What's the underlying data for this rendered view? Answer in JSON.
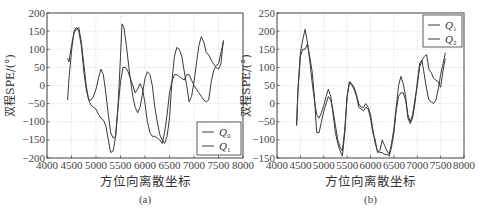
{
  "chart_data": [
    {
      "id": "a",
      "type": "line",
      "caption": "(a)",
      "xlabel": "方位向离散坐标",
      "ylabel": "双程SPE/(°)",
      "xlim": [
        4000,
        8000
      ],
      "ylim": [
        -200,
        200
      ],
      "xticks": [
        4000,
        4500,
        5000,
        5500,
        6000,
        6500,
        7000,
        7500,
        8000
      ],
      "yticks": [
        200,
        150,
        100,
        50,
        0,
        -50,
        -100,
        -150,
        -200
      ],
      "grid": true,
      "legend_position": "lower right",
      "series": [
        {
          "name": "Q0",
          "label_main": "Q",
          "label_sub": "0",
          "x": [
            4420,
            4450,
            4500,
            4550,
            4600,
            4650,
            4700,
            4750,
            4800,
            4850,
            4900,
            4950,
            5000,
            5050,
            5100,
            5150,
            5200,
            5250,
            5300,
            5350,
            5400,
            5450,
            5500,
            5530,
            5570,
            5620,
            5680,
            5750,
            5800,
            5850,
            5900,
            5950,
            6000,
            6050,
            6100,
            6150,
            6200,
            6250,
            6300,
            6350,
            6400,
            6450,
            6500,
            6550,
            6600,
            6650,
            6700,
            6750,
            6800,
            6850,
            6900,
            6950,
            7000,
            7050,
            7100,
            7150,
            7200,
            7250,
            7300,
            7350,
            7400,
            7450,
            7500,
            7550,
            7600
          ],
          "y": [
            -40,
            20,
            95,
            150,
            160,
            150,
            110,
            40,
            -10,
            -40,
            -40,
            -30,
            -10,
            20,
            45,
            30,
            -20,
            -80,
            -130,
            -145,
            -140,
            -60,
            80,
            170,
            160,
            110,
            40,
            -30,
            -60,
            -75,
            -60,
            -20,
            20,
            38,
            30,
            0,
            -60,
            -100,
            -135,
            -150,
            -160,
            -140,
            -90,
            10,
            80,
            105,
            100,
            80,
            40,
            0,
            -45,
            -30,
            10,
            60,
            110,
            135,
            120,
            90,
            85,
            70,
            60,
            50,
            45,
            60,
            125
          ]
        },
        {
          "name": "Q1",
          "label_main": "Q",
          "label_sub": "1",
          "x": [
            4420,
            4450,
            4500,
            4550,
            4600,
            4650,
            4700,
            4750,
            4800,
            4850,
            4900,
            4950,
            5000,
            5050,
            5100,
            5150,
            5200,
            5250,
            5300,
            5350,
            5400,
            5450,
            5500,
            5550,
            5600,
            5650,
            5700,
            5750,
            5800,
            5850,
            5900,
            5950,
            6000,
            6050,
            6100,
            6150,
            6200,
            6250,
            6300,
            6350,
            6400,
            6450,
            6500,
            6550,
            6600,
            6650,
            6700,
            6750,
            6800,
            6850,
            6900,
            6950,
            7000,
            7050,
            7100,
            7150,
            7200,
            7250,
            7300,
            7350,
            7400,
            7450,
            7500,
            7550,
            7600
          ],
          "y": [
            75,
            65,
            110,
            145,
            155,
            160,
            120,
            60,
            0,
            -40,
            -55,
            -60,
            -65,
            -80,
            -90,
            -95,
            -110,
            -150,
            -185,
            -180,
            -140,
            -60,
            10,
            50,
            50,
            40,
            20,
            0,
            -20,
            -10,
            5,
            -10,
            -50,
            -100,
            -130,
            -140,
            -140,
            -145,
            -150,
            -160,
            -130,
            -80,
            -20,
            10,
            30,
            30,
            25,
            20,
            15,
            30,
            30,
            15,
            0,
            -10,
            -20,
            -30,
            -40,
            -45,
            -40,
            10,
            40,
            55,
            60,
            90,
            120
          ]
        }
      ]
    },
    {
      "id": "b",
      "type": "line",
      "caption": "(b)",
      "xlabel": "方位向离散坐标",
      "ylabel": "双程SPE/(°)",
      "xlim": [
        4000,
        8000
      ],
      "ylim": [
        -150,
        250
      ],
      "xticks": [
        4000,
        4500,
        5000,
        5500,
        6000,
        6500,
        7000,
        7500,
        8000
      ],
      "yticks": [
        250,
        200,
        150,
        100,
        50,
        0,
        -50,
        -100,
        -150
      ],
      "grid": true,
      "legend_position": "upper right",
      "series": [
        {
          "name": "Q1",
          "label_main": "Q",
          "label_sub": "1",
          "x": [
            4420,
            4450,
            4500,
            4550,
            4600,
            4650,
            4700,
            4750,
            4800,
            4850,
            4900,
            4950,
            5000,
            5050,
            5100,
            5150,
            5200,
            5250,
            5300,
            5350,
            5400,
            5450,
            5500,
            5550,
            5600,
            5650,
            5700,
            5750,
            5800,
            5850,
            5900,
            5950,
            6000,
            6050,
            6100,
            6150,
            6200,
            6250,
            6300,
            6350,
            6400,
            6450,
            6500,
            6550,
            6600,
            6650,
            6700,
            6750,
            6800,
            6850,
            6900,
            6950,
            7000,
            7050,
            7100,
            7150,
            7200,
            7250,
            7300,
            7350,
            7400,
            7450,
            7500,
            7550,
            7600
          ],
          "y": [
            -60,
            40,
            140,
            175,
            205,
            170,
            120,
            60,
            10,
            -30,
            -40,
            -25,
            -5,
            20,
            40,
            20,
            -30,
            -80,
            -110,
            -130,
            -145,
            -80,
            20,
            60,
            50,
            40,
            20,
            -10,
            -15,
            -20,
            -10,
            -15,
            -40,
            -80,
            -100,
            -135,
            -130,
            -100,
            -115,
            -130,
            -140,
            -110,
            -70,
            -10,
            50,
            75,
            55,
            20,
            -40,
            -55,
            -40,
            0,
            60,
            110,
            120,
            80,
            40,
            10,
            5,
            0,
            10,
            40,
            80,
            110,
            140
          ]
        },
        {
          "name": "Q2",
          "label_main": "Q",
          "label_sub": "2",
          "x": [
            4420,
            4450,
            4500,
            4550,
            4600,
            4650,
            4700,
            4750,
            4800,
            4850,
            4900,
            4950,
            5000,
            5050,
            5100,
            5150,
            5200,
            5250,
            5300,
            5350,
            5400,
            5450,
            5500,
            5550,
            5600,
            5650,
            5700,
            5750,
            5800,
            5850,
            5900,
            5950,
            6000,
            6050,
            6100,
            6150,
            6200,
            6250,
            6300,
            6350,
            6400,
            6450,
            6500,
            6550,
            6600,
            6650,
            6700,
            6750,
            6800,
            6850,
            6900,
            6950,
            7000,
            7050,
            7100,
            7150,
            7200,
            7250,
            7300,
            7350,
            7400,
            7450,
            7500,
            7550,
            7600
          ],
          "y": [
            -60,
            40,
            130,
            150,
            150,
            165,
            130,
            90,
            20,
            -80,
            -80,
            -50,
            -20,
            0,
            20,
            10,
            -20,
            -60,
            -100,
            -120,
            -130,
            -70,
            20,
            60,
            55,
            45,
            25,
            0,
            -10,
            -10,
            0,
            -10,
            -30,
            -70,
            -110,
            -130,
            -135,
            -135,
            -140,
            -140,
            -145,
            -120,
            -80,
            -20,
            20,
            30,
            30,
            10,
            -30,
            -50,
            -30,
            10,
            50,
            100,
            120,
            130,
            135,
            95,
            85,
            70,
            65,
            60,
            45,
            90,
            125
          ]
        }
      ]
    }
  ],
  "figure": {
    "panels": [
      {
        "caption": "(a)",
        "xlabel": "方位向离散坐标",
        "ylabel": "双程SPE/(°)"
      },
      {
        "caption": "(b)",
        "xlabel": "方位向离散坐标",
        "ylabel": "双程SPE/(°)"
      }
    ]
  },
  "layout": {
    "panels": [
      {
        "left": 47,
        "right": 243,
        "top": 13,
        "bottom": 158,
        "xlabel_y": 186,
        "caption_y": 203,
        "ylabel_x": 14,
        "legend": {
          "x": 197,
          "y": 122,
          "w": 44,
          "h": 33
        }
      },
      {
        "left": 277,
        "right": 464,
        "top": 13,
        "bottom": 158,
        "xlabel_y": 186,
        "caption_y": 203,
        "ylabel_x": 250,
        "legend": {
          "x": 423,
          "y": 15,
          "w": 39,
          "h": 32
        }
      }
    ],
    "line_color": "#3a3a3a",
    "grid_color": "#d0d0d0",
    "axis_color": "#333333"
  }
}
